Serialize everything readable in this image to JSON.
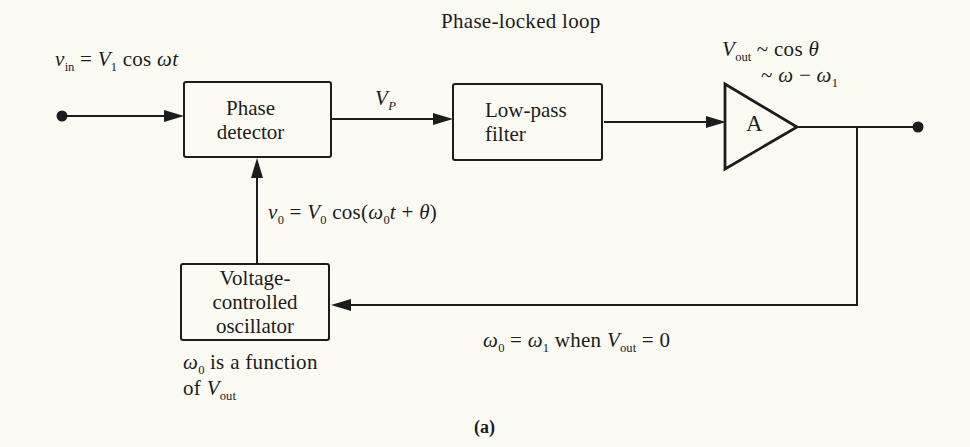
{
  "title": "Phase-locked loop",
  "caption": "(a)",
  "colors": {
    "ink": "#1c1c1c",
    "paper": "#fbfaf3"
  },
  "blocks": {
    "phase_detector": {
      "lines": [
        "Phase",
        "detector"
      ]
    },
    "low_pass_filter": {
      "lines": [
        "Low-pass",
        "filter"
      ]
    },
    "vco": {
      "lines": [
        "Voltage-",
        "controlled",
        "oscillator"
      ]
    },
    "amplifier": {
      "label": "A"
    }
  },
  "formulas": {
    "input_signal": [
      {
        "t": "v",
        "s": "i"
      },
      {
        "t": "in",
        "s": "sub"
      },
      {
        "t": " = ",
        "s": "n"
      },
      {
        "t": "V",
        "s": "i"
      },
      {
        "t": "1",
        "s": "sub"
      },
      {
        "t": " cos ",
        "s": "n"
      },
      {
        "t": "ωt",
        "s": "i"
      }
    ],
    "vp": [
      {
        "t": "V",
        "s": "i"
      },
      {
        "t": "P",
        "s": "subi"
      }
    ],
    "output_relation_1": [
      {
        "t": "V",
        "s": "i"
      },
      {
        "t": "out",
        "s": "sub"
      },
      {
        "t": " ~ cos ",
        "s": "n"
      },
      {
        "t": "θ",
        "s": "i"
      }
    ],
    "output_relation_2": [
      {
        "t": "~ ",
        "s": "n"
      },
      {
        "t": "ω",
        "s": "i"
      },
      {
        "t": " − ",
        "s": "n"
      },
      {
        "t": "ω",
        "s": "i"
      },
      {
        "t": "1",
        "s": "sub"
      }
    ],
    "vco_output": [
      {
        "t": "v",
        "s": "i"
      },
      {
        "t": "0",
        "s": "sub"
      },
      {
        "t": " = ",
        "s": "n"
      },
      {
        "t": "V",
        "s": "i"
      },
      {
        "t": "0",
        "s": "sub"
      },
      {
        "t": " cos(",
        "s": "n"
      },
      {
        "t": "ω",
        "s": "i"
      },
      {
        "t": "0",
        "s": "sub"
      },
      {
        "t": "t",
        "s": "i"
      },
      {
        "t": " + ",
        "s": "n"
      },
      {
        "t": "θ",
        "s": "i"
      },
      {
        "t": ")",
        "s": "n"
      }
    ],
    "lock_condition": [
      {
        "t": "ω",
        "s": "i"
      },
      {
        "t": "0",
        "s": "sub"
      },
      {
        "t": " = ",
        "s": "n"
      },
      {
        "t": "ω",
        "s": "i"
      },
      {
        "t": "1",
        "s": "sub"
      },
      {
        "t": " when ",
        "s": "n"
      },
      {
        "t": "V",
        "s": "i"
      },
      {
        "t": "out",
        "s": "sub"
      },
      {
        "t": " = 0",
        "s": "n"
      }
    ],
    "vco_note_1": [
      {
        "t": "ω",
        "s": "i"
      },
      {
        "t": "0",
        "s": "sub"
      },
      {
        "t": " is a function",
        "s": "n"
      }
    ],
    "vco_note_2": [
      {
        "t": "of ",
        "s": "n"
      },
      {
        "t": "V",
        "s": "i"
      },
      {
        "t": "out",
        "s": "sub"
      }
    ]
  }
}
